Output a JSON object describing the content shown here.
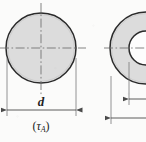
{
  "figure": {
    "title_text": "",
    "background_color": "#fbfbfa",
    "line_color": "#2b2b2b",
    "fill_color": "#dcdcdc",
    "centerline_color": "#6e6e6e",
    "dimension_color": "#5a5a5a",
    "labels": {
      "diameter_symbol": "d",
      "stress_open_paren": "(",
      "stress_symbol": "τ",
      "stress_subscript": "A",
      "stress_close_paren": ")"
    },
    "shapes": [
      {
        "name": "solid-circular-cross-section",
        "type": "circle",
        "center_x": 41,
        "center_y": 48,
        "radius": 35,
        "filled": true
      },
      {
        "name": "hollow-annular-cross-section",
        "type": "annulus",
        "center_x": 146,
        "center_y": 48,
        "outer_radius": 36,
        "inner_radius": 17,
        "filled": true,
        "clipped_at_right_edge": true
      }
    ],
    "dimensions": [
      {
        "name": "outer-diameter-dimension-left",
        "label": "d",
        "y": 110,
        "x_start": 7,
        "x_end": 76,
        "arrowheads": "both"
      },
      {
        "name": "outer-diameter-dimension-right",
        "label": "",
        "y": 118,
        "x_start": 111,
        "x_end": 146,
        "arrowheads": "left"
      },
      {
        "name": "inner-diameter-dimension-right",
        "label": "",
        "y": 99,
        "x_start": 129,
        "x_end": 146,
        "arrowheads": "left"
      }
    ],
    "centerlines": [
      {
        "name": "horizontal-centerline-left",
        "orientation": "horizontal",
        "y": 48
      },
      {
        "name": "vertical-centerline-left",
        "orientation": "vertical",
        "x": 41
      },
      {
        "name": "horizontal-centerline-right",
        "orientation": "horizontal",
        "y": 48
      }
    ]
  }
}
